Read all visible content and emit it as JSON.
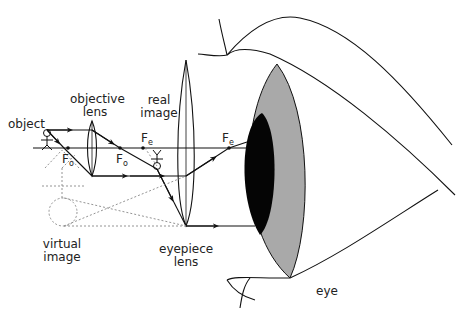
{
  "labels": {
    "object": "object",
    "objective_lens_line1": "objective",
    "objective_lens_line2": "lens",
    "real_image_line1": "real",
    "real_image_line2": "image",
    "virtual_image_line1": "virtual",
    "virtual_image_line2": "image",
    "eyepiece_lens_line1": "eyepiece",
    "eyepiece_lens_line2": "lens",
    "eye": "eye"
  },
  "focal_points": {
    "objective_left": {
      "main": "F",
      "sub": "o"
    },
    "objective_right": {
      "main": "F",
      "sub": "o"
    },
    "eyepiece_left": {
      "main": "F",
      "sub": "e"
    },
    "eyepiece_right": {
      "main": "F",
      "sub": "e"
    }
  },
  "colors": {
    "line": "#111111",
    "iris": "#a8a8a8",
    "pupil": "#050505",
    "dashed": "#777777"
  }
}
